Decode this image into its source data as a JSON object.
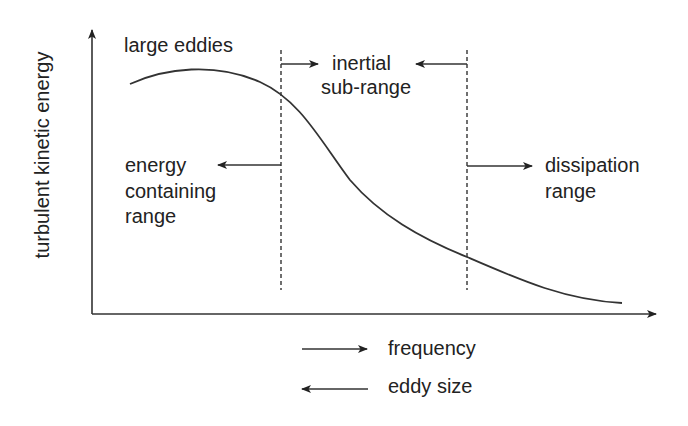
{
  "diagram": {
    "title": "",
    "y_axis_label": "turbulent kinetic energy",
    "annotations": {
      "large_eddies": "large eddies",
      "inertial_line1": "inertial",
      "inertial_line2": "sub-range",
      "energy_line1": "energy",
      "energy_line2": "containing",
      "energy_line3": "range",
      "dissipation_line1": "dissipation",
      "dissipation_line2": "range"
    },
    "legend": [
      {
        "direction": "right",
        "label": "frequency"
      },
      {
        "direction": "left",
        "label": "eddy size"
      }
    ],
    "colors": {
      "line": "#222222",
      "background": "#ffffff"
    },
    "regions": [
      "energy containing range",
      "inertial sub-range",
      "dissipation range"
    ]
  }
}
